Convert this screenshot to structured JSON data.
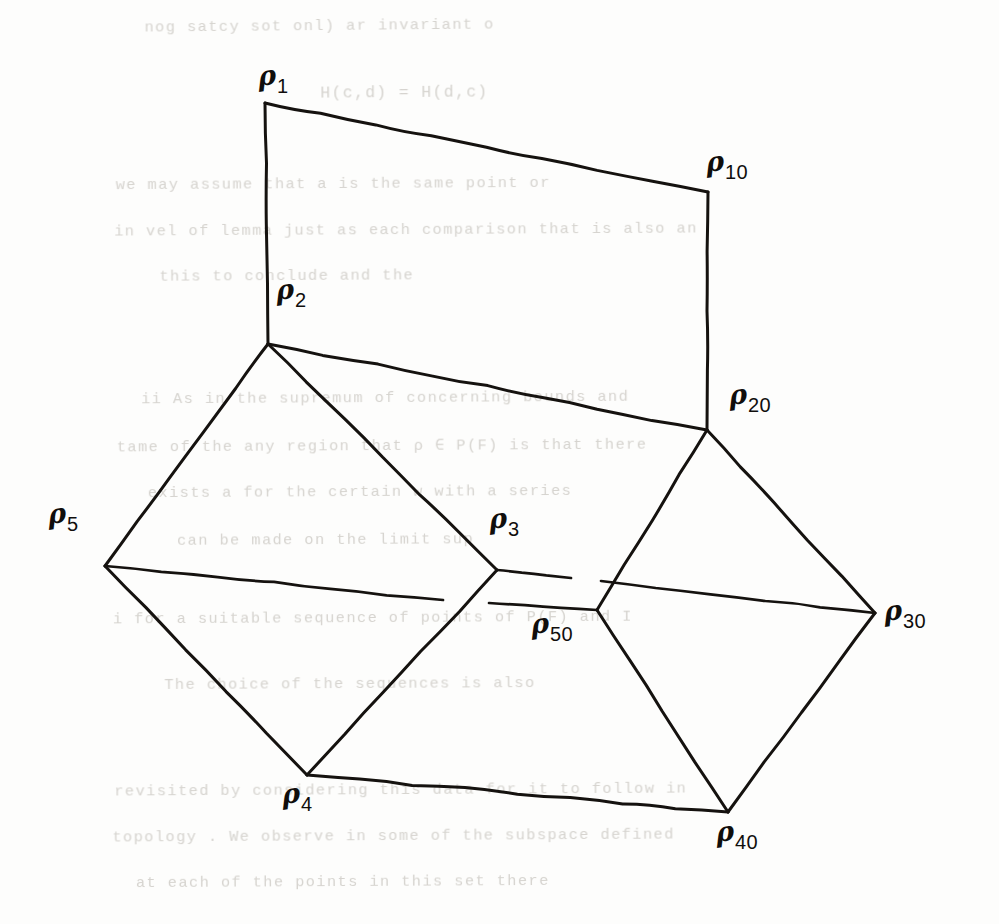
{
  "figure": {
    "kind": "hand-drawn line diagram",
    "medium": "ink on paper, photocopied",
    "ink_color": "#15120f",
    "paper_color": "#fdfdfc",
    "bleedthrough_color": "#c9c6c0",
    "width": 999,
    "height": 924
  },
  "vertices": [
    {
      "id": "p1",
      "symbol": "ρ",
      "subscript": "1",
      "x": 265,
      "y": 103,
      "label_x": 258,
      "label_y": 62
    },
    {
      "id": "p10",
      "symbol": "ρ",
      "subscript": "10",
      "x": 708,
      "y": 192,
      "label_x": 706,
      "label_y": 148
    },
    {
      "id": "p2",
      "symbol": "ρ",
      "subscript": "2",
      "x": 268,
      "y": 344,
      "label_x": 276,
      "label_y": 276
    },
    {
      "id": "p20",
      "symbol": "ρ",
      "subscript": "20",
      "x": 707,
      "y": 430,
      "label_x": 729,
      "label_y": 381
    },
    {
      "id": "p5",
      "symbol": "ρ",
      "subscript": "5",
      "x": 105,
      "y": 566,
      "label_x": 48,
      "label_y": 500
    },
    {
      "id": "p3",
      "symbol": "ρ",
      "subscript": "3",
      "x": 497,
      "y": 570,
      "label_x": 489,
      "label_y": 505
    },
    {
      "id": "p30",
      "symbol": "ρ",
      "subscript": "30",
      "x": 875,
      "y": 613,
      "label_x": 884,
      "label_y": 597
    },
    {
      "id": "p50",
      "symbol": "ρ",
      "subscript": "50",
      "x": 597,
      "y": 610,
      "label_x": 531,
      "label_y": 610
    },
    {
      "id": "p4",
      "symbol": "ρ",
      "subscript": "4",
      "x": 307,
      "y": 775,
      "label_x": 282,
      "label_y": 780
    },
    {
      "id": "p40",
      "symbol": "ρ",
      "subscript": "40",
      "x": 728,
      "y": 812,
      "label_x": 716,
      "label_y": 818
    }
  ],
  "edges": [
    {
      "id": "e-p1-p10",
      "from": "p1",
      "to": "p10",
      "note": "top edge of upper quadrilateral"
    },
    {
      "id": "e-p1-p2",
      "from": "p1",
      "to": "p2",
      "note": "left edge of upper quadrilateral"
    },
    {
      "id": "e-p10-p20",
      "from": "p10",
      "to": "p20",
      "note": "right edge of upper quadrilateral"
    },
    {
      "id": "e-p2-p20",
      "from": "p2",
      "to": "p20",
      "note": "bottom edge of upper quadrilateral"
    },
    {
      "id": "e-p2-p3",
      "from": "p2",
      "to": "p3",
      "note": "upper-right edge of left diamond"
    },
    {
      "id": "e-p2-p5",
      "from": "p2",
      "to": "p5",
      "note": "upper-left edge of left diamond"
    },
    {
      "id": "e-p5-p4",
      "from": "p5",
      "to": "p4",
      "note": "lower-left edge of left diamond"
    },
    {
      "id": "e-p3-p4",
      "from": "p3",
      "to": "p4",
      "note": "lower-right edge of left diamond"
    },
    {
      "id": "e-p20-p50",
      "from": "p20",
      "to": "p50",
      "note": "upper-left edge of right diamond"
    },
    {
      "id": "e-p20-p30",
      "from": "p20",
      "to": "p30",
      "note": "upper-right edge of right diamond"
    },
    {
      "id": "e-p30-p40",
      "from": "p30",
      "to": "p40",
      "note": "lower-right edge of right diamond"
    },
    {
      "id": "e-p50-p40",
      "from": "p50",
      "to": "p40",
      "note": "lower-left edge of right diamond"
    },
    {
      "id": "e-p4-p40",
      "from": "p4",
      "to": "p40",
      "note": "bottom edge joining the two diamonds"
    }
  ],
  "cut_edges": [
    {
      "id": "cut-p5-right",
      "from": "p5",
      "to_x": 443,
      "to_y": 600,
      "note": "horizontal ray leaving ρ5, terminated short of ρ3"
    },
    {
      "id": "cut-p3-right",
      "from": "p3",
      "to_x": 571,
      "to_y": 578,
      "note": "horizontal ray leaving ρ3, terminated short of ρ30"
    },
    {
      "id": "cut-p50-left",
      "from": "p50",
      "to_x": 489,
      "to_y": 603,
      "note": "horizontal ray leaving ρ50, terminated short of ρ5"
    },
    {
      "id": "cut-p30-left",
      "from": "p30",
      "to_x": 601,
      "to_y": 581,
      "note": "horizontal ray leaving ρ30, terminated short of ρ3"
    }
  ],
  "bleedthrough_text": [
    {
      "text": "nog satcy sot onl) ar invariant o",
      "x": 148,
      "y": 18,
      "size": 15,
      "rot": -0.5
    },
    {
      "text": "H(c,d)  =  H(d,c)",
      "x": 322,
      "y": 84,
      "size": 16,
      "rot": -0.4
    },
    {
      "text": "we may assume  that  a  is  the same point  or",
      "x": 120,
      "y": 176,
      "size": 15,
      "rot": -0.3
    },
    {
      "text": "in  vel   of  lemma just  as  each comparison that  is  also  an",
      "x": 120,
      "y": 222,
      "size": 15,
      "rot": -0.3
    },
    {
      "text": "this  to  conclude  and  the",
      "x": 162,
      "y": 268,
      "size": 15,
      "rot": -0.3
    },
    {
      "text": "ii   As  in  the  supremum  of  concerning  bounds  and",
      "x": 146,
      "y": 390,
      "size": 15,
      "rot": -0.3
    },
    {
      "text": "tame  of  the  any  region  that  ρ  ∈  P(F)  is  that  there",
      "x": 122,
      "y": 436,
      "size": 15,
      "rot": -0.3
    },
    {
      "text": "exists  a  for  the  certain  w  with  a  series",
      "x": 152,
      "y": 484,
      "size": 15,
      "rot": -0.3
    },
    {
      "text": "can  be  made  on  the  limit  sup",
      "x": 180,
      "y": 532,
      "size": 15,
      "rot": -0.3
    },
    {
      "text": "i  for  a  suitable  sequence   of  points  of  P(F)  and  I",
      "x": 118,
      "y": 610,
      "size": 15,
      "rot": -0.3
    },
    {
      "text": "The  choice  of  the  sequences  is  also",
      "x": 168,
      "y": 676,
      "size": 15,
      "rot": -0.3
    },
    {
      "text": "revisited  by  considering  this  data  for  it  to  follow  in",
      "x": 120,
      "y": 782,
      "size": 15,
      "rot": -0.3
    },
    {
      "text": "topology .  We  observe  in  some  of  the  subspace  defined",
      "x": 118,
      "y": 828,
      "size": 15,
      "rot": -0.3
    },
    {
      "text": "at  each  of  the  points  in  this  set  there",
      "x": 140,
      "y": 874,
      "size": 15,
      "rot": -0.3
    }
  ]
}
